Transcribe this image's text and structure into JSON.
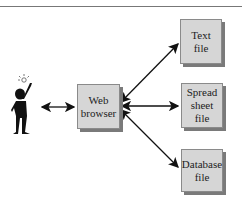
{
  "diagram": {
    "nodes": {
      "user": {
        "label": "",
        "icon": "person-with-lightbulb"
      },
      "browser": {
        "label": "Web\nbrowser"
      },
      "text_file": {
        "label": "Text\nfile"
      },
      "spreadsheet_file": {
        "label": "Spread\nsheet\nfile"
      },
      "database_file": {
        "label": "Database\nfile"
      }
    },
    "edges": [
      {
        "from": "user",
        "to": "browser",
        "type": "bidirectional"
      },
      {
        "from": "browser",
        "to": "text_file",
        "type": "bidirectional"
      },
      {
        "from": "browser",
        "to": "spreadsheet_file",
        "type": "bidirectional"
      },
      {
        "from": "browser",
        "to": "database_file",
        "type": "bidirectional"
      }
    ],
    "colors": {
      "box_fill": "#d6d6d6",
      "box_shadow": "#7a7a7a",
      "line": "#111111"
    }
  }
}
